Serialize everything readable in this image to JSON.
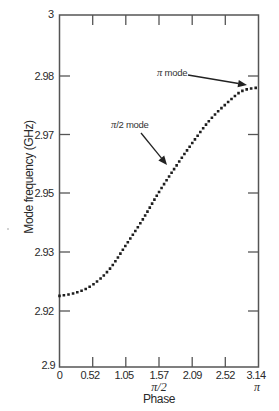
{
  "chart_data": {
    "type": "line",
    "title": "",
    "xlabel": "Phase",
    "ylabel": "Mode frequency (GHz)",
    "xlim": [
      0,
      3.14
    ],
    "ylim": [
      2.9,
      3.0
    ],
    "grid": false,
    "legend": null,
    "x_ticks": [
      {
        "value": 0,
        "label": "0"
      },
      {
        "value": 0.52,
        "label": "0.52"
      },
      {
        "value": 1.05,
        "label": "1.05"
      },
      {
        "value": 1.57,
        "label": "1.57"
      },
      {
        "value": 2.09,
        "label": "2.09"
      },
      {
        "value": 2.62,
        "label": "2.52"
      },
      {
        "value": 3.14,
        "label": "3.14"
      }
    ],
    "x_tick_sublabels": [
      {
        "at": 1.57,
        "label": "π/2"
      },
      {
        "at": 3.14,
        "label": "π"
      }
    ],
    "y_ticks": [
      {
        "value": 3.0,
        "label": "3"
      },
      {
        "value": 2.98,
        "label": "2.98"
      },
      {
        "value": 2.97,
        "label": "2.97"
      },
      {
        "value": 2.95,
        "label": "2.95"
      },
      {
        "value": 2.93,
        "label": "2.93"
      },
      {
        "value": 2.92,
        "label": "2.92"
      },
      {
        "value": 2.9,
        "label": "2.9"
      }
    ],
    "series": [
      {
        "name": "Mode frequency",
        "style": "dotted",
        "x": [
          0,
          0.26,
          0.52,
          0.79,
          1.05,
          1.31,
          1.57,
          1.83,
          2.09,
          2.36,
          2.62,
          2.88,
          3.14
        ],
        "y": [
          2.9202,
          2.9211,
          2.9233,
          2.9278,
          2.9347,
          2.9418,
          2.9497,
          2.9568,
          2.9635,
          2.9699,
          2.9746,
          2.9784,
          2.9794
        ]
      }
    ],
    "annotations": [
      {
        "text": "π mode",
        "symbol": "π",
        "suffix": " mode",
        "points_to": [
          3.14,
          2.9794
        ]
      },
      {
        "text": "π/2 mode",
        "symbol": "π",
        "suffix": "/2 mode",
        "points_to": [
          1.57,
          2.9497
        ]
      }
    ]
  }
}
